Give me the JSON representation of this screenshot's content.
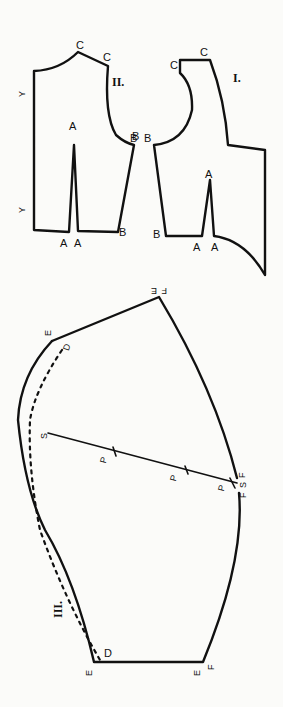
{
  "diagram": {
    "type": "sewing-pattern",
    "pieces": [
      {
        "id": "II",
        "label": "II.",
        "point_labels": {
          "c1": "C",
          "c2": "C",
          "a_top": "A",
          "a_l": "A",
          "a_r": "A",
          "b_top": "B",
          "b_bot": "B",
          "y1": "Y",
          "y2": "Y"
        }
      },
      {
        "id": "I",
        "label": "I.",
        "point_labels": {
          "c1": "C",
          "c2": "C",
          "b_top": "B",
          "b_bot": "B",
          "b_left": "B",
          "a_top": "A",
          "a_l": "A",
          "a_r": "A"
        }
      },
      {
        "id": "III",
        "label": "III.",
        "point_labels": {
          "e_top": "E",
          "f_top": "F",
          "e_left": "E",
          "d_left": "D",
          "s_left": "S",
          "p1": "P",
          "p2": "P",
          "p3": "P",
          "f_right": "F",
          "s_right": "S",
          "f_right2": "F",
          "e_bot_l": "E",
          "d_bot": "D",
          "e_bot_r": "E",
          "f_bot": "F"
        }
      }
    ]
  }
}
